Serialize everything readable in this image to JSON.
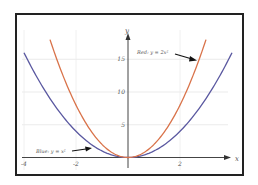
{
  "chart_data": {
    "type": "line",
    "title": "",
    "xlabel": "x",
    "ylabel": "y",
    "xlim": [
      -4.1,
      4.2
    ],
    "ylim": [
      -0.5,
      18
    ],
    "grid": true,
    "x_ticks": [
      -4,
      -2,
      2
    ],
    "x_tick_labels": [
      "-4",
      "-2",
      "2"
    ],
    "y_ticks": [
      5,
      10,
      15
    ],
    "y_tick_labels": [
      "5",
      "10",
      "15"
    ],
    "series": [
      {
        "name": "Blue: y = x²",
        "color": "#5a58a0",
        "function": "x^2",
        "x_range": [
          -4,
          4
        ],
        "x": [
          -4,
          -3,
          -2,
          -1,
          0,
          1,
          2,
          3,
          4
        ],
        "values": [
          16,
          9,
          4,
          1,
          0,
          1,
          4,
          9,
          16
        ]
      },
      {
        "name": "Red: y = 2x²",
        "color": "#d9734a",
        "function": "2x^2",
        "x_range": [
          -3,
          3
        ],
        "x": [
          -3,
          -2,
          -1,
          0,
          1,
          2,
          3
        ],
        "values": [
          18,
          8,
          2,
          0,
          2,
          8,
          18
        ]
      }
    ],
    "annotations": [
      {
        "text": "Red: y = 2x²",
        "arrow_to": [
          2.7,
          14.6
        ]
      },
      {
        "text": "Blue: y = x²",
        "arrow_to": [
          -1.2,
          1.4
        ]
      }
    ]
  },
  "labels": {
    "x_axis": "x",
    "y_axis": "y",
    "red_annotation": "Red: y = 2x²",
    "blue_annotation": "Blue: y = x²",
    "tick_x": [
      "-4",
      "-2",
      "2"
    ],
    "tick_y": [
      "5",
      "10",
      "15"
    ]
  }
}
